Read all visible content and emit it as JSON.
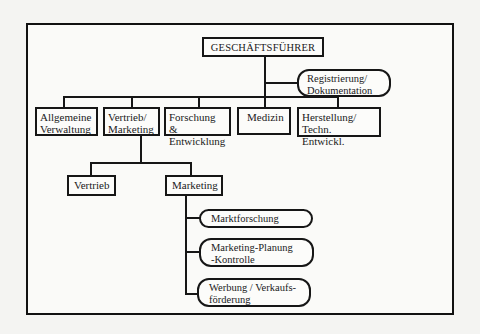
{
  "chart": {
    "root": {
      "label": "GESCHÄFTSFÜHRER"
    },
    "staff": {
      "label": "Registrierung/\nDokumentation"
    },
    "departments": [
      {
        "label": "Allgemeine\nVerwaltung"
      },
      {
        "label": "Vertrieb/\nMarketing"
      },
      {
        "label": "Forschung &\nEntwicklung"
      },
      {
        "label": "Medizin"
      },
      {
        "label": "Herstellung/\nTechn. Entwickl."
      }
    ],
    "sales_marketing_children": [
      {
        "label": "Vertrieb"
      },
      {
        "label": "Marketing"
      }
    ],
    "marketing_children": [
      {
        "label": "Marktforschung"
      },
      {
        "label": "Marketing-Planung\n-Kontrolle"
      },
      {
        "label": "Werbung / Verkaufs-\nförderung"
      }
    ]
  },
  "colors": {
    "line": "#161616",
    "background": "#f4f4f2"
  }
}
